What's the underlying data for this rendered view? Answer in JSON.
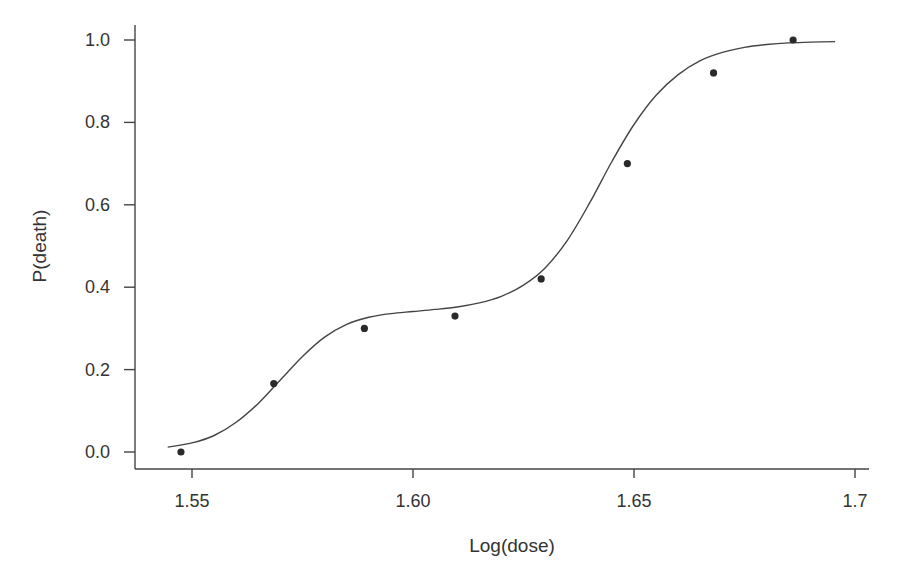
{
  "chart_data": {
    "type": "scatter",
    "title": "",
    "xlabel": "Log(dose)",
    "ylabel": "P(death)",
    "xlim": [
      1.543,
      1.703
    ],
    "ylim": [
      -0.04,
      1.0
    ],
    "grid": false,
    "legend": null,
    "x_ticks": [
      1.55,
      1.6,
      1.65,
      1.7
    ],
    "x_tick_labels": [
      "1.55",
      "1.60",
      "1.65",
      "1.70"
    ],
    "y_ticks": [
      0.0,
      0.2,
      0.4,
      0.6,
      0.8,
      1.0
    ],
    "y_tick_labels": [
      "0.0",
      "0.2",
      "0.4",
      "0.6",
      "0.8",
      "1.0"
    ],
    "series": [
      {
        "name": "observed",
        "kind": "points",
        "x": [
          1.5475,
          1.5685,
          1.589,
          1.6095,
          1.629,
          1.6485,
          1.668,
          1.686
        ],
        "y": [
          0.0,
          0.166,
          0.3,
          0.33,
          0.42,
          0.7,
          0.92,
          1.0
        ]
      },
      {
        "name": "fitted curve",
        "kind": "line",
        "x": [
          1.5445,
          1.55,
          1.555,
          1.56,
          1.565,
          1.57,
          1.575,
          1.58,
          1.585,
          1.59,
          1.595,
          1.6,
          1.605,
          1.61,
          1.615,
          1.62,
          1.625,
          1.63,
          1.635,
          1.64,
          1.645,
          1.65,
          1.655,
          1.66,
          1.665,
          1.67,
          1.675,
          1.68,
          1.685,
          1.69,
          1.6955
        ],
        "y": [
          0.012,
          0.022,
          0.04,
          0.072,
          0.118,
          0.175,
          0.232,
          0.279,
          0.31,
          0.327,
          0.336,
          0.341,
          0.346,
          0.352,
          0.362,
          0.378,
          0.405,
          0.448,
          0.515,
          0.605,
          0.705,
          0.795,
          0.866,
          0.916,
          0.95,
          0.97,
          0.982,
          0.989,
          0.993,
          0.995,
          0.996
        ]
      }
    ]
  },
  "labels": {
    "xlabel": "Log(dose)",
    "ylabel": "P(death)",
    "x_ticks": [
      "1.55",
      "1.60",
      "1.65",
      "1.7"
    ],
    "y_ticks": [
      "0.0",
      "0.2",
      "0.4",
      "0.6",
      "0.8",
      "1.0"
    ]
  },
  "colors": {
    "ink": "#333333",
    "axis": "#444444",
    "point": "#2a2a2a",
    "background": "#ffffff"
  }
}
